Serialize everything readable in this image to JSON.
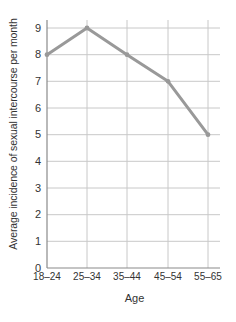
{
  "chart_data": {
    "type": "line",
    "title": "",
    "xlabel": "Age",
    "ylabel": "Average incidence of sexual intercourse per month",
    "categories": [
      "18–24",
      "25–34",
      "35–44",
      "45–54",
      "55–65"
    ],
    "values": [
      8,
      9,
      8,
      7,
      5
    ],
    "series": [
      {
        "name": "Average incidence of sexual intercourse per month",
        "values": [
          8,
          9,
          8,
          7,
          5
        ]
      }
    ],
    "ylim": [
      0,
      9
    ],
    "yticks": [
      0,
      1,
      2,
      3,
      4,
      5,
      6,
      7,
      8,
      9
    ],
    "ytick_labels": [
      "0",
      "1",
      "2",
      "3",
      "4",
      "5",
      "6",
      "7",
      "8",
      "9"
    ],
    "grid": true,
    "legend": "none",
    "line_color": "#999999",
    "grid_color": "#c8c8c8",
    "axis_color": "#8a8a8a"
  },
  "axes": {
    "y_title": "Average incidence of sexual intercourse per month",
    "x_title": "Age"
  }
}
